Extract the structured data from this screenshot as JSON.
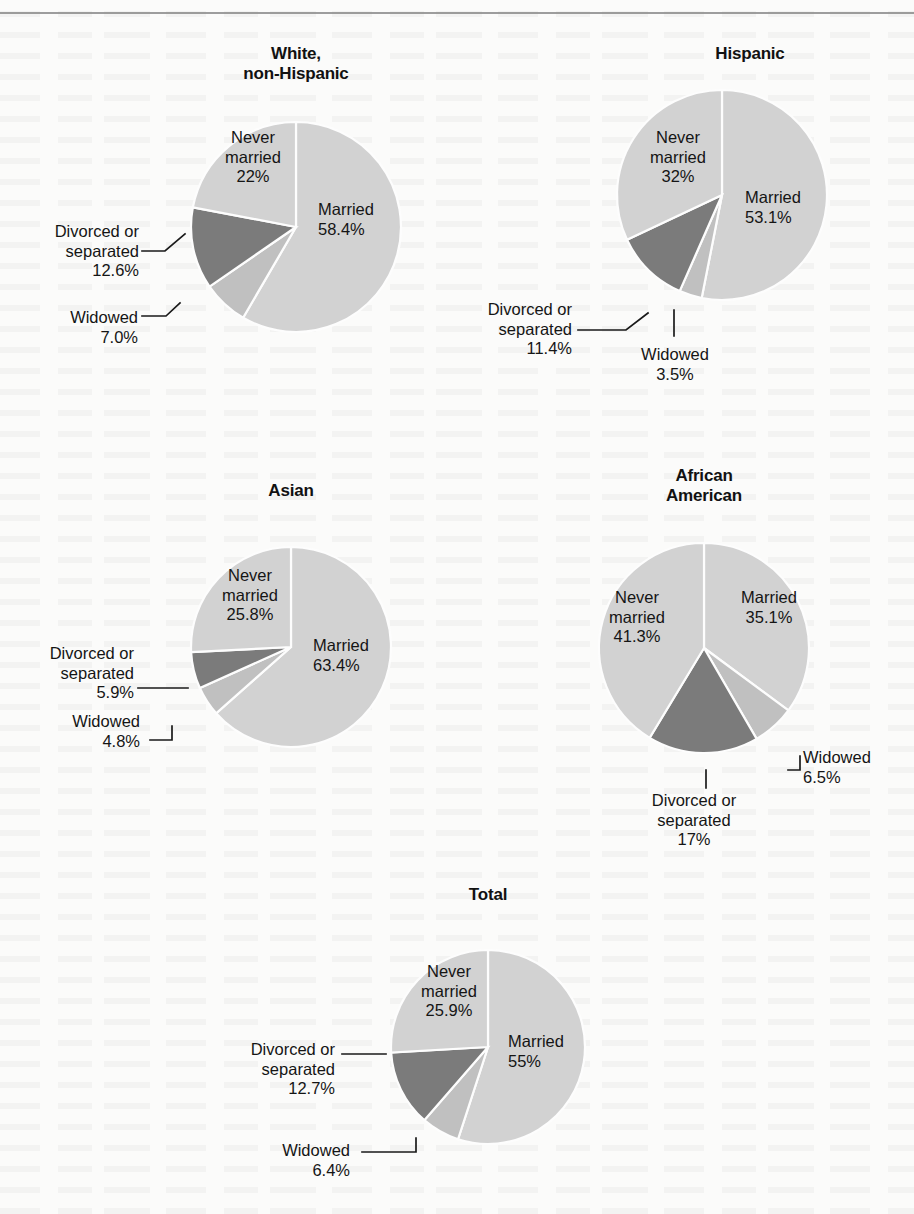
{
  "page": {
    "background_color": "#fbfbfa",
    "has_top_rule": true
  },
  "palette": {
    "married": "#d2d2d2",
    "never_married": "#d2d2d2",
    "widowed": "#c0c0c0",
    "divorced_or_separated": "#7b7b7b",
    "slice_border": "#fdfdfd",
    "text": "#151515"
  },
  "charts": [
    {
      "id": "white-non-hispanic",
      "title": "White,\nnon-Hispanic",
      "labels": {
        "married": "Married\n58.4%",
        "never_married": "Never\nmarried\n22%",
        "divorced_or_separated": "Divorced or\nseparated\n12.6%",
        "widowed": "Widowed\n7.0%"
      }
    },
    {
      "id": "hispanic",
      "title": "Hispanic",
      "labels": {
        "married": "Married\n53.1%",
        "never_married": "Never\nmarried\n32%",
        "divorced_or_separated": "Divorced or\nseparated\n11.4%",
        "widowed": "Widowed\n3.5%"
      }
    },
    {
      "id": "asian",
      "title": "Asian",
      "labels": {
        "married": "Married\n63.4%",
        "never_married": "Never\nmarried\n25.8%",
        "divorced_or_separated": "Divorced or\nseparated\n5.9%",
        "widowed": "Widowed\n4.8%"
      }
    },
    {
      "id": "african-american",
      "title": "African\nAmerican",
      "labels": {
        "married": "Married\n35.1%",
        "never_married": "Never\nmarried\n41.3%",
        "divorced_or_separated": "Divorced or\nseparated\n17%",
        "widowed": "Widowed\n6.5%"
      }
    },
    {
      "id": "total",
      "title": "Total",
      "labels": {
        "married": "Married\n55%",
        "never_married": "Never\nmarried\n25.9%",
        "divorced_or_separated": "Divorced or\nseparated\n12.7%",
        "widowed": "Widowed\n6.4%"
      }
    }
  ],
  "chart_data": [
    {
      "type": "pie",
      "title": "White, non-Hispanic",
      "categories": [
        "Married",
        "Widowed",
        "Divorced or separated",
        "Never married"
      ],
      "values": [
        58.4,
        7.0,
        12.6,
        22.0
      ],
      "units": "percent",
      "start_angle_deg": 0,
      "direction": "clockwise",
      "legend": "labels placed inside and outside slices with leader lines"
    },
    {
      "type": "pie",
      "title": "Hispanic",
      "categories": [
        "Married",
        "Widowed",
        "Divorced or separated",
        "Never married"
      ],
      "values": [
        53.1,
        3.5,
        11.4,
        32.0
      ],
      "units": "percent",
      "start_angle_deg": 0,
      "direction": "clockwise",
      "legend": "labels placed inside and outside slices with leader lines"
    },
    {
      "type": "pie",
      "title": "Asian",
      "categories": [
        "Married",
        "Widowed",
        "Divorced or separated",
        "Never married"
      ],
      "values": [
        63.4,
        4.8,
        5.9,
        25.8
      ],
      "units": "percent",
      "start_angle_deg": 0,
      "direction": "clockwise",
      "legend": "labels placed inside and outside slices with leader lines"
    },
    {
      "type": "pie",
      "title": "African American",
      "categories": [
        "Married",
        "Widowed",
        "Divorced or separated",
        "Never married"
      ],
      "values": [
        35.1,
        6.5,
        17.0,
        41.3
      ],
      "units": "percent",
      "start_angle_deg": 0,
      "direction": "clockwise",
      "legend": "labels placed inside and outside slices with leader lines"
    },
    {
      "type": "pie",
      "title": "Total",
      "categories": [
        "Married",
        "Widowed",
        "Divorced or separated",
        "Never married"
      ],
      "values": [
        55.0,
        6.4,
        12.7,
        25.9
      ],
      "units": "percent",
      "start_angle_deg": 0,
      "direction": "clockwise",
      "legend": "labels placed inside and outside slices with leader lines"
    }
  ]
}
